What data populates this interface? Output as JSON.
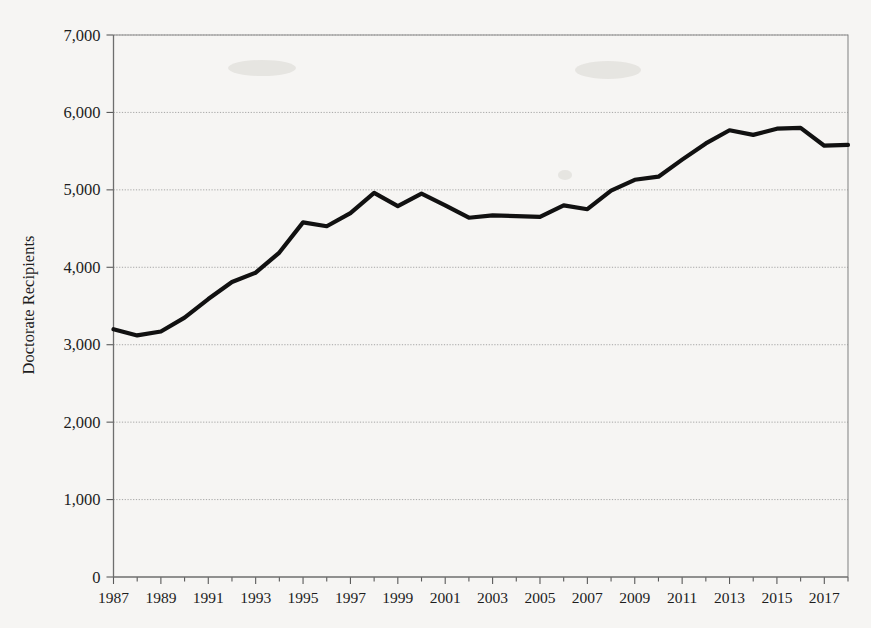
{
  "chart_data": {
    "type": "line",
    "title": "",
    "xlabel": "",
    "ylabel": "Doctorate Recipients",
    "xlim": [
      1987,
      2018
    ],
    "ylim": [
      0,
      7000
    ],
    "grid": true,
    "legend": "none",
    "x": [
      1987,
      1988,
      1989,
      1990,
      1991,
      1992,
      1993,
      1994,
      1995,
      1996,
      1997,
      1998,
      1999,
      2000,
      2001,
      2002,
      2003,
      2004,
      2005,
      2006,
      2007,
      2008,
      2009,
      2010,
      2011,
      2012,
      2013,
      2014,
      2015,
      2016,
      2017,
      2018
    ],
    "values": [
      3200,
      3120,
      3170,
      3350,
      3590,
      3810,
      3930,
      4190,
      4580,
      4530,
      4700,
      4960,
      4790,
      4950,
      4800,
      4640,
      4670,
      4660,
      4650,
      4800,
      4750,
      4990,
      5130,
      5170,
      5390,
      5600,
      5770,
      5710,
      5790,
      5800,
      5570,
      5580
    ],
    "ytick_labels": [
      "7,000",
      "6,000",
      "5,000",
      "4,000",
      "3,000",
      "2,000",
      "1,000",
      "0"
    ],
    "ytick_values": [
      7000,
      6000,
      5000,
      4000,
      3000,
      2000,
      1000,
      0
    ],
    "xtick_labels": [
      "1987",
      "1989",
      "1991",
      "1993",
      "1995",
      "1997",
      "1999",
      "2001",
      "2003",
      "2005",
      "2007",
      "2009",
      "2011",
      "2013",
      "2015",
      "2017"
    ],
    "xtick_values": [
      1987,
      1989,
      1991,
      1993,
      1995,
      1997,
      1999,
      2001,
      2003,
      2005,
      2007,
      2009,
      2011,
      2013,
      2015,
      2017
    ],
    "line_color": "#111111",
    "grid_color": "#8e8e8e",
    "background_color": "#f6f5f3"
  }
}
